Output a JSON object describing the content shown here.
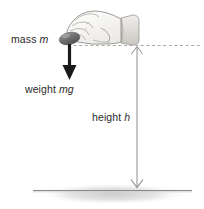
{
  "figure": {
    "name": "falling-mass-height-diagram",
    "background_color": "#ffffff",
    "width": 204,
    "height": 209
  },
  "labels": {
    "mass": {
      "text": "mass",
      "symbol": "m"
    },
    "weight": {
      "text": "weight",
      "symbol": "mg"
    },
    "height": {
      "text": "height",
      "symbol": "h"
    }
  },
  "colors": {
    "text": "#2b2b2b",
    "arrow_dark": "#1a1a1a",
    "arrow_light": "#8c8c8c",
    "dashed_line": "#a8a8a8",
    "ground_line": "#808080",
    "ground_shadow": "#d4d4d4",
    "ball_fill": "#6e6e6e",
    "hand_outline": "#8a8a8a",
    "hand_fill": "#f4f2f0",
    "sleeve_fill": "#dcdad6"
  },
  "elements": {
    "hand": "hand-holding-ball-illustration",
    "ball": "ball-mass-object",
    "dashed_level_line": "release-height-dashed-line",
    "weight_arrow": "weight-force-down-arrow",
    "height_arrow": "height-double-headed-arrow",
    "ground": "ground-surface-line",
    "shadow": "ground-shadow-ellipse"
  }
}
